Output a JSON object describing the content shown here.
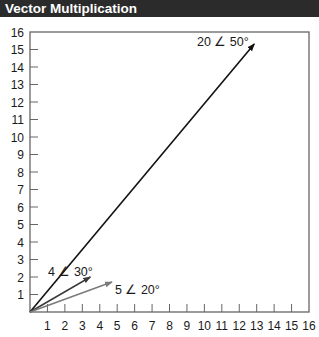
{
  "header": {
    "title": "Vector Multiplication"
  },
  "chart_data": {
    "type": "line",
    "title": "Vector Multiplication",
    "xlabel": "",
    "ylabel": "",
    "xlim": [
      0,
      16
    ],
    "ylim": [
      0,
      16
    ],
    "x_ticks": [
      1,
      2,
      3,
      4,
      5,
      6,
      7,
      8,
      9,
      10,
      11,
      12,
      13,
      14,
      15,
      16
    ],
    "y_ticks": [
      1,
      2,
      3,
      4,
      5,
      6,
      7,
      8,
      9,
      10,
      11,
      12,
      13,
      14,
      15,
      16
    ],
    "grid": false,
    "series": [
      {
        "name": "20 ∠ 50°",
        "magnitude": 20,
        "angle_deg": 50,
        "start": [
          0,
          0
        ],
        "end": [
          12.86,
          15.32
        ],
        "color": "#111111"
      },
      {
        "name": "4 ∠ 30°",
        "magnitude": 4,
        "angle_deg": 30,
        "start": [
          0,
          0
        ],
        "end": [
          3.46,
          2.0
        ],
        "color": "#3a3a3a"
      },
      {
        "name": "5 ∠ 20°",
        "magnitude": 5,
        "angle_deg": 20,
        "start": [
          0,
          0
        ],
        "end": [
          4.7,
          1.71
        ],
        "color": "#7a7a7a"
      }
    ],
    "annotations": [
      "20 ∠ 50°",
      "4 ∠ 30°",
      "5 ∠ 20°"
    ]
  },
  "labels": {
    "v1": "20 ∠ 50°",
    "v2": "4 ∠ 30°",
    "v3": "5 ∠ 20°"
  },
  "colors": {
    "header_bg": "#2b2b2b",
    "header_text": "#ffffff",
    "axis": "#666666"
  }
}
